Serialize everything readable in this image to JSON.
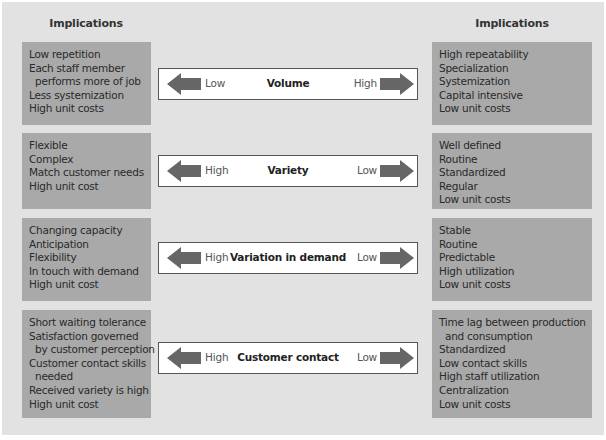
{
  "headings": {
    "left": "Implications",
    "right": "Implications"
  },
  "colors": {
    "panel": "#e2e2e2",
    "implication_box": "#a9a9a9",
    "arrow": "#666666",
    "bar_background": "#ffffff"
  },
  "rows": [
    {
      "dimension": "Volume",
      "left_end": "Low",
      "right_end": "High",
      "left_implications": [
        {
          "text": "Low repetition",
          "indent": false
        },
        {
          "text": "Each staff member",
          "indent": false
        },
        {
          "text": "performs more of job",
          "indent": true
        },
        {
          "text": "Less systemization",
          "indent": false
        },
        {
          "text": "High unit costs",
          "indent": false
        }
      ],
      "right_implications": [
        {
          "text": "High repeatability",
          "indent": false
        },
        {
          "text": "Specialization",
          "indent": false
        },
        {
          "text": "Systemization",
          "indent": false
        },
        {
          "text": "Capital intensive",
          "indent": false
        },
        {
          "text": "Low unit costs",
          "indent": false
        }
      ]
    },
    {
      "dimension": "Variety",
      "left_end": "High",
      "right_end": "Low",
      "left_implications": [
        {
          "text": "Flexible",
          "indent": false
        },
        {
          "text": "Complex",
          "indent": false
        },
        {
          "text": "Match customer needs",
          "indent": false
        },
        {
          "text": "High unit cost",
          "indent": false
        }
      ],
      "right_implications": [
        {
          "text": "Well defined",
          "indent": false
        },
        {
          "text": "Routine",
          "indent": false
        },
        {
          "text": "Standardized",
          "indent": false
        },
        {
          "text": "Regular",
          "indent": false
        },
        {
          "text": "Low unit costs",
          "indent": false
        }
      ]
    },
    {
      "dimension": "Variation in demand",
      "left_end": "High",
      "right_end": "Low",
      "left_implications": [
        {
          "text": "Changing capacity",
          "indent": false
        },
        {
          "text": "Anticipation",
          "indent": false
        },
        {
          "text": "Flexibility",
          "indent": false
        },
        {
          "text": "In touch with demand",
          "indent": false
        },
        {
          "text": "High unit cost",
          "indent": false
        }
      ],
      "right_implications": [
        {
          "text": "Stable",
          "indent": false
        },
        {
          "text": "Routine",
          "indent": false
        },
        {
          "text": "Predictable",
          "indent": false
        },
        {
          "text": "High utilization",
          "indent": false
        },
        {
          "text": "Low unit costs",
          "indent": false
        }
      ]
    },
    {
      "dimension": "Customer contact",
      "left_end": "High",
      "right_end": "Low",
      "left_implications": [
        {
          "text": "Short waiting tolerance",
          "indent": false
        },
        {
          "text": "Satisfaction governed",
          "indent": false
        },
        {
          "text": "by customer perception",
          "indent": true
        },
        {
          "text": "Customer contact skills",
          "indent": false
        },
        {
          "text": "needed",
          "indent": true
        },
        {
          "text": "Received variety is high",
          "indent": false
        },
        {
          "text": "High unit cost",
          "indent": false
        }
      ],
      "right_implications": [
        {
          "text": "Time lag between production",
          "indent": false
        },
        {
          "text": "and consumption",
          "indent": true
        },
        {
          "text": "Standardized",
          "indent": false
        },
        {
          "text": "Low contact skills",
          "indent": false
        },
        {
          "text": "High staff utilization",
          "indent": false
        },
        {
          "text": "Centralization",
          "indent": false
        },
        {
          "text": "Low unit costs",
          "indent": false
        }
      ]
    }
  ]
}
